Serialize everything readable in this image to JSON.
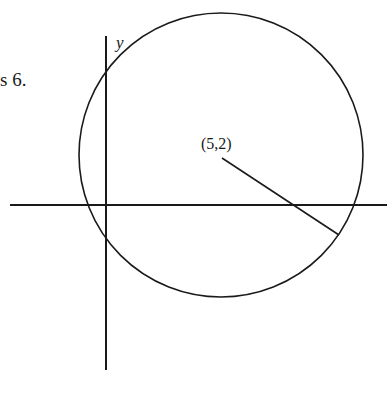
{
  "fragment_text": "s 6.",
  "axes": {
    "y_label": "y"
  },
  "center_label": "(5,2)",
  "colors": {
    "stroke": "#1a1a1a",
    "background": "#ffffff"
  },
  "geometry": {
    "circle": {
      "cx": 221,
      "cy": 155,
      "r": 142
    },
    "y_axis": {
      "x": 106,
      "y1": 36,
      "y2": 370
    },
    "x_axis": {
      "y": 205,
      "x1": 10,
      "x2": 387
    },
    "radius_segment": {
      "x1": 222,
      "y1": 158,
      "x2": 339,
      "y2": 235
    }
  }
}
